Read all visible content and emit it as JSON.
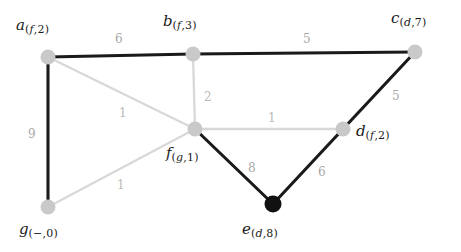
{
  "diagram": {
    "type": "weighted-undirected-graph",
    "title": "",
    "canvas": {
      "width": 461,
      "height": 252
    },
    "colors": {
      "node_fill_light": "#c9c9c9",
      "node_fill_dark": "#111111",
      "edge_dark": "#1a1a1a",
      "edge_light": "#d8d8d8",
      "weight_text": "#b9b9b9",
      "label_text": "#1b1b1b",
      "background": "#ffffff"
    },
    "nodes": [
      {
        "id": "a",
        "name": "a",
        "sub_parent": "f",
        "sub_dist": "2",
        "x": 48,
        "y": 57,
        "label_x": 16,
        "label_y": 18,
        "style": "light"
      },
      {
        "id": "b",
        "name": "b",
        "sub_parent": "f",
        "sub_dist": "3",
        "x": 193,
        "y": 54,
        "label_x": 163,
        "label_y": 14,
        "style": "light"
      },
      {
        "id": "c",
        "name": "c",
        "sub_parent": "d",
        "sub_dist": "7",
        "x": 415,
        "y": 52,
        "label_x": 391,
        "label_y": 11,
        "style": "light"
      },
      {
        "id": "d",
        "name": "d",
        "sub_parent": "f",
        "sub_dist": "2",
        "x": 343,
        "y": 129,
        "label_x": 356,
        "label_y": 124,
        "style": "light"
      },
      {
        "id": "e",
        "name": "e",
        "sub_parent": "d",
        "sub_dist": "8",
        "x": 273,
        "y": 204,
        "label_x": 242,
        "label_y": 222,
        "style": "dark"
      },
      {
        "id": "f",
        "name": "f",
        "sub_parent": "g",
        "sub_dist": "1",
        "x": 195,
        "y": 129,
        "label_x": 166,
        "label_y": 146,
        "style": "light"
      },
      {
        "id": "g",
        "name": "g",
        "sub_parent": "−",
        "sub_dist": "0",
        "x": 48,
        "y": 207,
        "label_x": 19,
        "label_y": 222,
        "style": "light"
      }
    ],
    "edges": [
      {
        "from": "a",
        "to": "b",
        "weight": "6",
        "style": "dark",
        "label_x": 115,
        "label_y": 33
      },
      {
        "from": "b",
        "to": "c",
        "weight": "5",
        "style": "dark",
        "label_x": 303,
        "label_y": 33
      },
      {
        "from": "a",
        "to": "g",
        "weight": "9",
        "style": "dark",
        "label_x": 28,
        "label_y": 128
      },
      {
        "from": "c",
        "to": "d",
        "weight": "5",
        "style": "dark",
        "label_x": 392,
        "label_y": 90
      },
      {
        "from": "f",
        "to": "e",
        "weight": "8",
        "style": "dark",
        "label_x": 248,
        "label_y": 162
      },
      {
        "from": "d",
        "to": "e",
        "weight": "6",
        "style": "dark",
        "label_x": 318,
        "label_y": 166
      },
      {
        "from": "a",
        "to": "f",
        "weight": "1",
        "style": "light",
        "label_x": 119,
        "label_y": 107
      },
      {
        "from": "b",
        "to": "f",
        "weight": "2",
        "style": "light",
        "label_x": 204,
        "label_y": 91
      },
      {
        "from": "f",
        "to": "d",
        "weight": "1",
        "style": "light",
        "label_x": 268,
        "label_y": 112
      },
      {
        "from": "g",
        "to": "f",
        "weight": "1",
        "style": "light",
        "label_x": 117,
        "label_y": 179
      }
    ]
  }
}
